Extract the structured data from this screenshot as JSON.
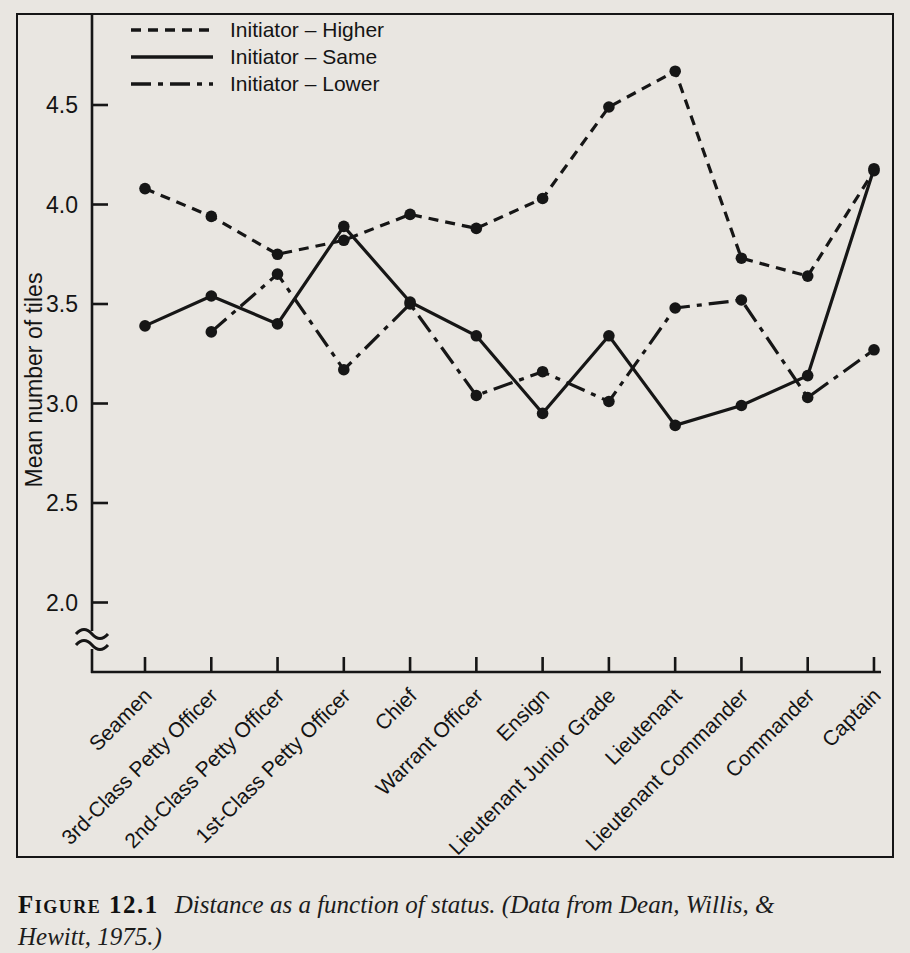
{
  "figure": {
    "caption_label": "Figure 12.1",
    "caption_line1": "Distance as a function of status. (Data from Dean, Willis, &",
    "caption_line2": "Hewitt, 1975.)"
  },
  "chart_data": {
    "type": "line",
    "title": "",
    "xlabel": "",
    "ylabel": "Mean number of tiles",
    "categories": [
      "Seamen",
      "3rd-Class Petty Officer",
      "2nd-Class Petty Officer",
      "1st-Class Petty Officer",
      "Chief",
      "Warrant Officer",
      "Ensign",
      "Lieutenant Junior Grade",
      "Lieutenant",
      "Lieutenant Commander",
      "Commander",
      "Captain"
    ],
    "yticks": [
      2.0,
      2.5,
      3.0,
      3.5,
      4.0,
      4.5
    ],
    "ylim": [
      1.75,
      4.78
    ],
    "y_axis_break": true,
    "grid": false,
    "legend_position": "top-left",
    "line_color": "#161616",
    "series": [
      {
        "name": "Initiator – Higher",
        "style": "dashed",
        "values": [
          4.08,
          3.94,
          3.75,
          3.82,
          3.95,
          3.88,
          4.03,
          4.49,
          4.67,
          3.73,
          3.64,
          4.17
        ]
      },
      {
        "name": "Initiator – Same",
        "style": "solid",
        "values": [
          3.39,
          3.54,
          3.4,
          3.89,
          3.51,
          3.34,
          2.95,
          3.34,
          2.89,
          2.99,
          3.14,
          4.18
        ]
      },
      {
        "name": "Initiator – Lower",
        "style": "dashdot",
        "values": [
          null,
          3.36,
          3.65,
          3.17,
          3.5,
          3.04,
          3.16,
          3.01,
          3.48,
          3.52,
          3.03,
          3.27
        ]
      }
    ]
  }
}
